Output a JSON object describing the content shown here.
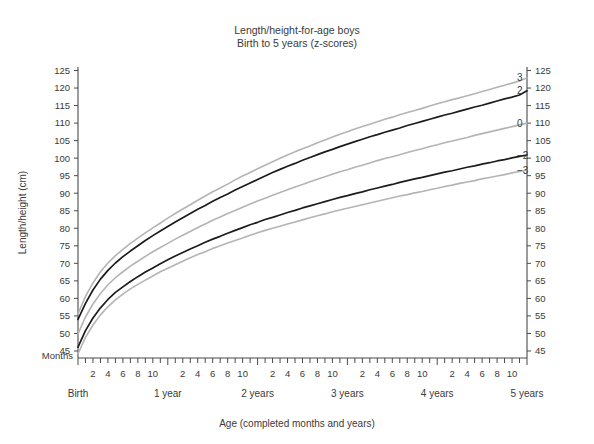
{
  "chart_data": {
    "type": "line",
    "title": "Length/height-for-age boys",
    "subtitle": "Birth to 5 years (z-scores)",
    "xlabel": "Age (completed months and years)",
    "ylabel": "Length/height (cm)",
    "x_unit_label": "Months",
    "grid": false,
    "legend_position": "right-inline",
    "xlim": [
      0,
      60
    ],
    "ylim": [
      43,
      126
    ],
    "y_ticks": [
      45,
      50,
      55,
      60,
      65,
      70,
      75,
      80,
      85,
      90,
      95,
      100,
      105,
      110,
      115,
      120,
      125
    ],
    "y_ticks_right": [
      45,
      50,
      55,
      60,
      65,
      70,
      75,
      80,
      85,
      90,
      95,
      100,
      105,
      110,
      115,
      120,
      125
    ],
    "x_month_ticks": [
      2,
      4,
      6,
      8,
      10
    ],
    "x_year_labels": [
      "Birth",
      "1 year",
      "2 years",
      "3 years",
      "4 years",
      "5 years"
    ],
    "x_year_positions": [
      0,
      12,
      24,
      36,
      48,
      60
    ],
    "x_months": [
      0,
      1,
      2,
      3,
      4,
      5,
      6,
      7,
      8,
      9,
      10,
      11,
      12,
      13,
      14,
      15,
      16,
      17,
      18,
      19,
      20,
      21,
      22,
      23,
      24,
      25,
      26,
      27,
      28,
      29,
      30,
      31,
      32,
      33,
      34,
      35,
      36,
      37,
      38,
      39,
      40,
      41,
      42,
      43,
      44,
      45,
      46,
      47,
      48,
      49,
      50,
      51,
      52,
      53,
      54,
      55,
      56,
      57,
      58,
      59,
      60
    ],
    "series": [
      {
        "name": "3",
        "label": "3",
        "color": "#b4b4b4",
        "end_value": 124.0,
        "values": [
          55.6,
          60.6,
          64.4,
          67.6,
          70.1,
          72.2,
          74.0,
          75.7,
          77.2,
          78.7,
          80.1,
          81.5,
          82.9,
          84.2,
          85.5,
          86.7,
          88.0,
          89.2,
          90.4,
          91.5,
          92.6,
          93.8,
          94.9,
          95.9,
          97.0,
          98.0,
          99.0,
          100.0,
          100.9,
          101.8,
          102.7,
          103.5,
          104.4,
          105.2,
          106.0,
          106.8,
          107.5,
          108.3,
          109.0,
          109.7,
          110.4,
          111.1,
          111.7,
          112.4,
          113.0,
          113.6,
          114.2,
          114.9,
          115.5,
          116.1,
          116.7,
          117.2,
          117.8,
          118.4,
          119.0,
          119.6,
          120.2,
          120.8,
          121.4,
          122.0,
          122.9
        ]
      },
      {
        "name": "2",
        "label": "2",
        "color": "#1c1c1c",
        "end_value": 119.6,
        "values": [
          54.0,
          58.6,
          62.4,
          65.5,
          68.0,
          70.1,
          71.9,
          73.5,
          75.0,
          76.5,
          77.9,
          79.2,
          80.5,
          81.8,
          83.0,
          84.2,
          85.4,
          86.5,
          87.7,
          88.8,
          89.8,
          90.9,
          91.9,
          92.9,
          93.9,
          94.9,
          95.9,
          96.8,
          97.7,
          98.5,
          99.4,
          100.2,
          101.0,
          101.8,
          102.5,
          103.3,
          104.0,
          104.7,
          105.4,
          106.1,
          106.7,
          107.4,
          108.0,
          108.6,
          109.3,
          109.9,
          110.5,
          111.1,
          111.7,
          112.3,
          112.8,
          113.4,
          114.0,
          114.6,
          115.1,
          115.7,
          116.3,
          116.9,
          117.4,
          118.0,
          119.2
        ]
      },
      {
        "name": "0",
        "label": "0",
        "color": "#b4b4b4",
        "end_value": 110.0,
        "values": [
          49.9,
          54.7,
          58.4,
          61.4,
          63.9,
          65.9,
          67.6,
          69.2,
          70.6,
          72.0,
          73.3,
          74.5,
          75.7,
          76.9,
          78.0,
          79.1,
          80.2,
          81.2,
          82.3,
          83.2,
          84.2,
          85.1,
          86.0,
          86.9,
          87.8,
          88.6,
          89.4,
          90.2,
          91.0,
          91.8,
          92.5,
          93.3,
          94.0,
          94.7,
          95.4,
          96.1,
          96.7,
          97.4,
          98.0,
          98.6,
          99.3,
          99.9,
          100.4,
          101.0,
          101.6,
          102.2,
          102.7,
          103.3,
          103.8,
          104.4,
          104.9,
          105.4,
          105.9,
          106.5,
          107.0,
          107.5,
          108.0,
          108.5,
          109.0,
          109.5,
          110.0
        ]
      },
      {
        "name": "-2",
        "label": "−2",
        "color": "#1c1c1c",
        "end_value": 100.7,
        "values": [
          46.1,
          50.8,
          54.4,
          57.3,
          59.7,
          61.7,
          63.3,
          64.8,
          66.2,
          67.5,
          68.7,
          69.9,
          71.0,
          72.1,
          73.1,
          74.1,
          75.0,
          76.0,
          76.9,
          77.7,
          78.6,
          79.4,
          80.2,
          81.0,
          81.7,
          82.5,
          83.1,
          83.8,
          84.5,
          85.1,
          85.8,
          86.4,
          87.0,
          87.6,
          88.2,
          88.8,
          89.3,
          89.9,
          90.4,
          91.0,
          91.5,
          92.0,
          92.5,
          93.1,
          93.6,
          94.1,
          94.5,
          95.0,
          95.5,
          96.0,
          96.4,
          96.9,
          97.4,
          97.8,
          98.3,
          98.7,
          99.2,
          99.6,
          100.1,
          100.5,
          100.9
        ]
      },
      {
        "name": "-3",
        "label": "−3",
        "color": "#b4b4b4",
        "end_value": 96.1,
        "values": [
          44.2,
          48.9,
          52.4,
          55.3,
          57.6,
          59.6,
          61.2,
          62.7,
          64.0,
          65.2,
          66.4,
          67.6,
          68.6,
          69.6,
          70.6,
          71.6,
          72.5,
          73.3,
          74.2,
          75.0,
          75.8,
          76.5,
          77.2,
          78.0,
          78.7,
          79.4,
          80.0,
          80.6,
          81.2,
          81.8,
          82.4,
          83.0,
          83.6,
          84.1,
          84.7,
          85.2,
          85.7,
          86.2,
          86.7,
          87.2,
          87.7,
          88.2,
          88.7,
          89.2,
          89.6,
          90.1,
          90.5,
          91.0,
          91.4,
          91.9,
          92.3,
          92.8,
          93.2,
          93.6,
          94.1,
          94.5,
          94.9,
          95.3,
          95.8,
          96.2,
          96.6
        ]
      }
    ]
  },
  "geometry": {
    "plot_left": 78,
    "plot_right": 527,
    "plot_top": 67,
    "plot_bottom": 358,
    "y_min": 43,
    "y_max": 126
  },
  "colors": {
    "grey_curve": "#b4b4b4",
    "black_curve": "#1c1c1c",
    "axis": "#4a4a4a",
    "text": "#3a3a3a",
    "background": "#ffffff"
  }
}
